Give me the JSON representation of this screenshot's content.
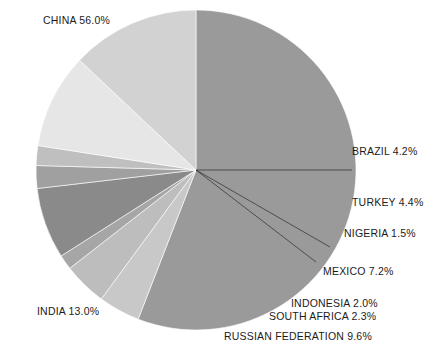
{
  "chart_data": {
    "type": "pie",
    "title": "",
    "categories": [
      "CHINA",
      "BRAZIL",
      "TURKEY",
      "NIGERIA",
      "MEXICO",
      "SOUTH AFRICA",
      "INDONESIA",
      "RUSSIAN FEDERATION",
      "INDIA"
    ],
    "values": [
      56.0,
      4.2,
      4.4,
      1.5,
      7.2,
      2.3,
      2.0,
      9.6,
      13.0
    ],
    "unit": "%",
    "start_angle_deg": 0,
    "direction": "clockwise",
    "legend": "none",
    "labels_position": "outside-with-leader-lines",
    "slices": [
      {
        "name": "CHINA",
        "label": "CHINA 56.0%",
        "value": 56.0,
        "color": "#9a9a9a"
      },
      {
        "name": "BRAZIL",
        "label": "BRAZIL 4.2%",
        "value": 4.2,
        "color": "#c8c8c8"
      },
      {
        "name": "TURKEY",
        "label": "TURKEY 4.4%",
        "value": 4.4,
        "color": "#bdbdbd"
      },
      {
        "name": "NIGERIA",
        "label": "NIGERIA 1.5%",
        "value": 1.5,
        "color": "#a6a6a6"
      },
      {
        "name": "MEXICO",
        "label": "MEXICO 7.2%",
        "value": 7.2,
        "color": "#8a8a8a"
      },
      {
        "name": "SOUTH AFRICA",
        "label": "SOUTH AFRICA 2.3%",
        "value": 2.3,
        "color": "#a0a0a0"
      },
      {
        "name": "INDONESIA",
        "label": "INDONESIA 2.0%",
        "value": 2.0,
        "color": "#bfbfbf"
      },
      {
        "name": "RUSSIAN FEDERATION",
        "label": "RUSSIAN FEDERATION 9.6%",
        "value": 9.6,
        "color": "#e6e6e6"
      },
      {
        "name": "INDIA",
        "label": "INDIA 13.0%",
        "value": 13.0,
        "color": "#d2d2d2"
      }
    ]
  },
  "labels": {
    "china": "CHINA 56.0%",
    "brazil": "BRAZIL 4.2%",
    "turkey": "TURKEY 4.4%",
    "nigeria": "NIGERIA 1.5%",
    "mexico": "MEXICO 7.2%",
    "indonesia": "INDONESIA 2.0%",
    "south_africa": "SOUTH AFRICA 2.3%",
    "russian_federation": "RUSSIAN FEDERATION 9.6%",
    "india": "INDIA 13.0%"
  },
  "caption": {
    "text": ""
  },
  "colors": {
    "background": "#ffffff",
    "text": "#1b1b1b",
    "leader_line": "#2b2b2b"
  }
}
